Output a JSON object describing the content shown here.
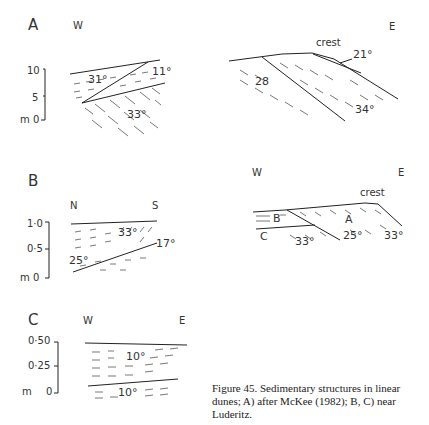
{
  "panels": {
    "A": {
      "label": "A",
      "left": {
        "dir_w": "W",
        "scale": [
          "10",
          "5",
          "m 0"
        ],
        "angles": [
          "31°",
          "11°",
          "33°"
        ]
      },
      "right": {
        "dir_e": "E",
        "crest": "crest",
        "angles": [
          "21°",
          "28",
          "34°"
        ]
      }
    },
    "B": {
      "label": "B",
      "left": {
        "dir_n": "N",
        "dir_s": "S",
        "scale": [
          "1·0",
          "0·5",
          "m 0"
        ],
        "angles": [
          "33°",
          "17°",
          "25°"
        ]
      },
      "right": {
        "dir_w": "W",
        "dir_e": "E",
        "crest": "crest",
        "units": [
          "B",
          "A",
          "C"
        ],
        "angles": [
          "25°",
          "33°",
          "33°"
        ]
      }
    },
    "C": {
      "label": "C",
      "dir_w": "W",
      "dir_e": "E",
      "scale": [
        "0·50",
        "0·25",
        "m",
        "0"
      ],
      "angles": [
        "10°",
        "10°"
      ]
    }
  },
  "caption": {
    "line1": "Figure 45. Sedimentary structures in linear",
    "line2": "dunes; A) after McKee (1982); B, C) near",
    "line3": "Luderitz."
  }
}
